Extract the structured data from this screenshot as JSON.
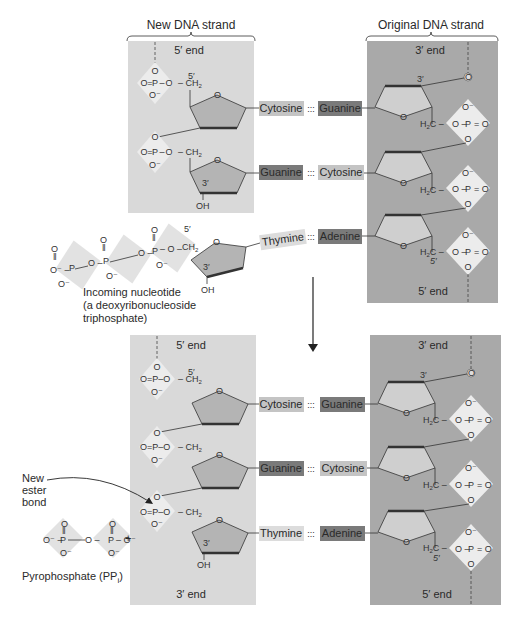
{
  "headers": {
    "new_strand": "New DNA strand",
    "original_strand": "Original DNA strand"
  },
  "ends": {
    "top_new_top": "5′ end",
    "top_orig_top": "3′ end",
    "top_orig_bottom": "5′ end",
    "bottom_new_top": "5′ end",
    "bottom_new_bottom": "3′ end",
    "bottom_orig_top": "3′ end",
    "bottom_orig_bottom": "5′ end"
  },
  "top_pairs": [
    {
      "left": "Cytosine",
      "right": "Guanine"
    },
    {
      "left": "Guanine",
      "right": "Cytosine"
    },
    {
      "left": "Thymine",
      "right": "Adenine"
    }
  ],
  "bottom_pairs": [
    {
      "left": "Cytosine",
      "right": "Guanine"
    },
    {
      "left": "Guanine",
      "right": "Cytosine"
    },
    {
      "left": "Thymine",
      "right": "Adenine"
    }
  ],
  "bond_symbol": ":::",
  "labels": {
    "incoming_line1": "Incoming nucleotide",
    "incoming_line2": "(a deoxyribonucleoside",
    "incoming_line3": "triphosphate)",
    "new_bond_line1": "New",
    "new_bond_line2": "ester",
    "new_bond_line3": "bond",
    "pyrophosphate": "Pyrophosphate (PP",
    "pyrophosphate_sub": "i",
    "pyrophosphate_close": ")",
    "plus": "+"
  },
  "chem": {
    "five_prime": "5′",
    "three_prime": "3′",
    "oh": "OH",
    "ch2": "CH",
    "h2c": "H",
    "sub2": "2",
    "o": "O",
    "o_minus": "O⁻",
    "p": "P"
  },
  "colors": {
    "panel_new": "#d9d9d9",
    "panel_original": "#a9a9a9",
    "base_light": "#c4c4c4",
    "base_dark": "#7a7a7a",
    "base_thymine": "#dcdcdc",
    "diamond": "#ececec",
    "sugar_fill": "#b4b4b4",
    "sugar_fill_light": "#cfcfcf"
  }
}
